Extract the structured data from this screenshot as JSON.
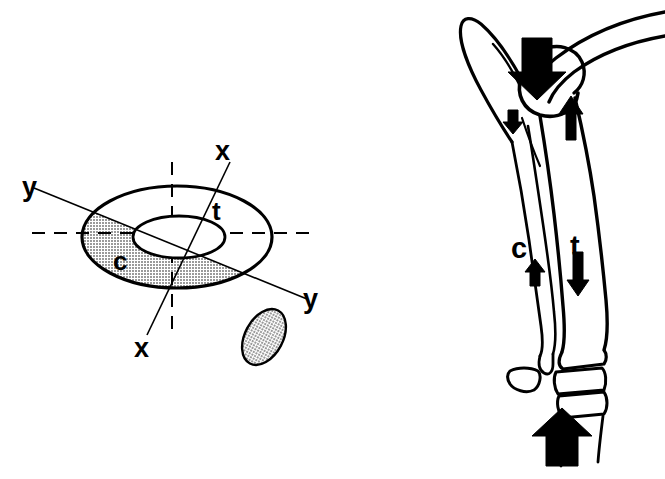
{
  "figure": {
    "background_color": "#ffffff",
    "ink_color": "#000000",
    "shade_color": "#c2c2c2",
    "panels": [
      {
        "id": "panel-a",
        "name": "tibia-cross-section",
        "description": "Transverse cross-section of tibia with principal axes",
        "labels": [
          {
            "name": "axis-label-y-upper-left",
            "text": "y",
            "x": 22,
            "y": 196
          },
          {
            "name": "axis-label-y-lower-right",
            "text": "y",
            "x": 303,
            "y": 308
          },
          {
            "name": "axis-label-x-upper-right",
            "text": "x",
            "x": 215,
            "y": 160
          },
          {
            "name": "axis-label-x-lower-left",
            "text": "x",
            "x": 134,
            "y": 357
          },
          {
            "name": "region-label-t",
            "text": "t",
            "x": 212,
            "y": 220
          },
          {
            "name": "region-label-c",
            "text": "c",
            "x": 113,
            "y": 270
          }
        ],
        "axes": [
          {
            "name": "axis-y-y",
            "from": [
              34,
              188
            ],
            "to": [
              307,
              299
            ]
          },
          {
            "name": "axis-x-x",
            "from": [
              230,
              162
            ],
            "to": [
              147,
              335
            ]
          },
          {
            "name": "axis-horizontal-dashed",
            "from": [
              32,
              233
            ],
            "to": [
              312,
              233
            ]
          },
          {
            "name": "axis-vertical-dashed",
            "from": [
              172,
              162
            ],
            "to": [
              172,
              330
            ]
          }
        ],
        "shapes": [
          {
            "name": "tibia-cortex-outline",
            "cx": 177,
            "cy": 237,
            "rx": 95,
            "ry": 51
          },
          {
            "name": "medullary-cavity",
            "cx": 179,
            "cy": 237,
            "rx": 46,
            "ry": 21
          },
          {
            "name": "fibula-cross-section",
            "cx": 264,
            "cy": 337,
            "rx": 19,
            "ry": 30,
            "rotate": 28
          }
        ]
      },
      {
        "id": "panel-b",
        "name": "lower-limb-loading",
        "description": "Lateral view of knee, tibia, fibula and ankle with load arrows",
        "labels": [
          {
            "name": "bone-label-c",
            "text": "c",
            "x": 516,
            "y": 250
          },
          {
            "name": "bone-label-t",
            "text": "t",
            "x": 573,
            "y": 248
          }
        ],
        "arrows": [
          {
            "name": "arrow-knee-load-down",
            "direction": "down",
            "size": "large",
            "x": 538,
            "y": 60
          },
          {
            "name": "arrow-fibula-down",
            "direction": "down",
            "size": "small",
            "x": 513,
            "y": 122
          },
          {
            "name": "arrow-tibia-up",
            "direction": "up",
            "size": "medium",
            "x": 570,
            "y": 116
          },
          {
            "name": "arrow-fibula-up",
            "direction": "up",
            "size": "small",
            "x": 535,
            "y": 272
          },
          {
            "name": "arrow-tibia-down",
            "direction": "down",
            "size": "medium",
            "x": 578,
            "y": 272
          },
          {
            "name": "arrow-ground-reaction",
            "direction": "up",
            "size": "large",
            "x": 562,
            "y": 443
          }
        ]
      }
    ]
  }
}
